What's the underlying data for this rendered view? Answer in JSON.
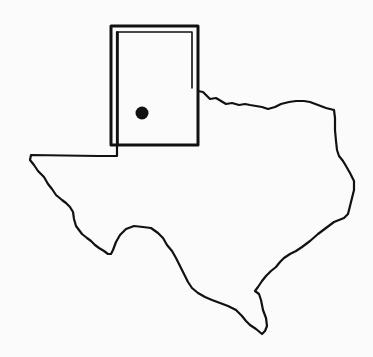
{
  "map": {
    "subject": "Texas state outline",
    "highlight_region": "Panhandle study area",
    "marker": "location dot",
    "colors": {
      "background": "#fbfbfb",
      "line": "#111111"
    }
  }
}
